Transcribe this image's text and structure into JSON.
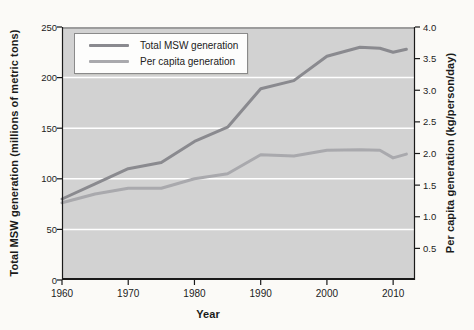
{
  "chart_data": {
    "type": "line",
    "xlabel": "Year",
    "x": [
      1960,
      1965,
      1970,
      1975,
      1980,
      1985,
      1990,
      1995,
      2000,
      2005,
      2008,
      2010,
      2012
    ],
    "series": [
      {
        "name": "Total MSW generation",
        "axis": "left",
        "color": "#8a8a8f",
        "values": [
          80,
          95,
          110,
          116,
          137,
          151,
          189,
          197,
          221,
          230,
          229,
          225,
          228
        ]
      },
      {
        "name": "Per capita generation",
        "axis": "right",
        "color": "#a9a9ad",
        "values": [
          1.22,
          1.36,
          1.45,
          1.45,
          1.6,
          1.68,
          1.98,
          1.96,
          2.05,
          2.06,
          2.05,
          1.93,
          1.99
        ]
      }
    ],
    "left_axis": {
      "label": "Total MSW generation (millions of metric tons)",
      "ticks": [
        0,
        50,
        100,
        150,
        200,
        250
      ],
      "range": [
        0,
        250
      ]
    },
    "right_axis": {
      "label": "Per capita generation (kg/person/day)",
      "ticks": [
        0.5,
        1.0,
        1.5,
        2.0,
        2.5,
        3.0,
        3.5,
        4.0
      ],
      "range": [
        0,
        4.0
      ]
    },
    "x_ticks": [
      1960,
      1970,
      1980,
      1990,
      2000,
      2010
    ],
    "x_range": [
      1960,
      2013.3
    ],
    "gridlines": [
      50,
      100,
      150,
      200
    ],
    "legend_position": "top-left",
    "colors": {
      "plot_bg": "#d2d2d2",
      "grid": "#ffffff",
      "axis": "#1a1a1a",
      "frame_top": "#9c9c9c",
      "page_bg": "#fbfaf7"
    }
  }
}
